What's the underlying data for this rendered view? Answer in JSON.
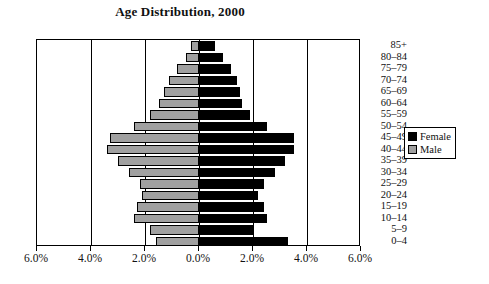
{
  "chart_data": {
    "type": "bar",
    "subtype": "population-pyramid",
    "title": "Age Distribution, 2000",
    "xlabel": "",
    "ylabel": "",
    "grid": true,
    "legend_position": "right",
    "axis_max_percent": 6.0,
    "xticks": [
      {
        "label": "6.0%",
        "value": -6.0
      },
      {
        "label": "4.0%",
        "value": -4.0
      },
      {
        "label": "2.0%",
        "value": -2.0
      },
      {
        "label": "0.0%",
        "value": 0.0
      },
      {
        "label": "2.0%",
        "value": 2.0
      },
      {
        "label": "4.0%",
        "value": 4.0
      },
      {
        "label": "6.0%",
        "value": 6.0
      }
    ],
    "categories": [
      "85+",
      "80–84",
      "75–79",
      "70–74",
      "65–69",
      "60–64",
      "55–59",
      "50–54",
      "45–49",
      "40–44",
      "35–39",
      "30–34",
      "25–29",
      "20–24",
      "15–19",
      "10–14",
      "5–9",
      "0–4"
    ],
    "series": [
      {
        "name": "Male",
        "color": "#a0a0a0",
        "values": [
          0.3,
          0.5,
          0.8,
          1.1,
          1.3,
          1.5,
          1.8,
          2.4,
          3.3,
          3.4,
          3.0,
          2.6,
          2.2,
          2.1,
          2.3,
          2.4,
          1.8,
          1.6
        ]
      },
      {
        "name": "Female",
        "color": "#000000",
        "values": [
          0.6,
          0.9,
          1.2,
          1.4,
          1.5,
          1.6,
          1.9,
          2.5,
          3.5,
          3.5,
          3.2,
          2.8,
          2.4,
          2.2,
          2.4,
          2.5,
          2.0,
          3.3
        ]
      }
    ]
  },
  "legend": {
    "items": [
      {
        "label": "Female",
        "swatch": "female"
      },
      {
        "label": "Male",
        "swatch": "male"
      }
    ]
  }
}
